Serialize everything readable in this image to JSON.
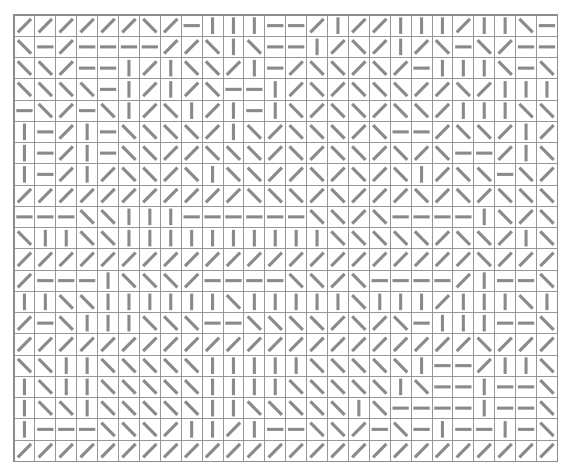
{
  "figure": {
    "name": "oriented-line-grid",
    "stimulus_type": "orientation-texture-array"
  },
  "grid": {
    "columns": 26,
    "rows": 21,
    "origin_x": 14,
    "origin_y": 15,
    "cell_width": 20.9,
    "cell_height": 21.25,
    "line_color": "#8c8c8c",
    "segment_color": "#8a8a8a",
    "background_color": "#ffffff",
    "segment_stroke_width": 3.1,
    "segment_length_ratio": 0.78
  },
  "legend": {
    "orientation_codes": {
      "f": "forward-slash (45 deg, bottom-left to top-right)",
      "b": "back-slash (135 deg, top-left to bottom-right)",
      "v": "vertical (90 deg)",
      "h": "horizontal (0 deg)"
    }
  },
  "cells": [
    "ffffffbfhvvvhhfvffvvvfvvbhhf",
    "bhfhhhhffbvbhhvfbfvfbhbfhhf",
    "bbfhhvfvbbfvhfbbfbfhvvvbhbf",
    "bbbbhvfvfbhhvfbfbbbffbfvvvb",
    "hbfhbvfbvfvhvbfbbfbbfvvvbbf",
    "vhfvhbbbbfvbfbbbfbhhfbbfvfb",
    "vhfvhbbffbbbfbfbbfbfbhhfvbf",
    "vhfvfbbfbvbbffbfbfbvfbbhbff",
    "fffffffffffbbbfbfffbfbfbbbf",
    "hhhbbvvvhhhhhhbbfbhhhhvbfbf",
    "bvvbbvvvvvvvvvvbbbbbfbbfvbh",
    "ffffffffffffffffffffffbfffb",
    "fhhhvbbbfhhhhbbfbhhhhfvhhbf",
    "vvbbvvvvvvbvvvvvbvvvfvvvbvf",
    "fhbvvvbbbhhbbbbfbfbhvvvhhbf",
    "ffffffffffffffffffffffbfffb",
    "bbvvbbbbbvvvvvbbbbbvhhfvvbb",
    "vbvvbbbbbvvvvbbbbbvbhhvhhbf",
    "vbbvbbbbbvvbbbbbvbhhhhvhhbf",
    "vhhhbbbfvvfvhhbbfhbhvhhvhbf",
    "fffffffffffffffffffffffffff"
  ],
  "cell_orientations": {
    "note": "Each string row encodes one grid row; characters map to legend.orientation_codes"
  }
}
